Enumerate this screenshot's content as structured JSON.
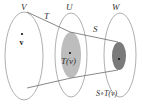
{
  "diagram": {
    "spaces": [
      {
        "id": "V",
        "label": "V",
        "point_label": "v"
      },
      {
        "id": "U",
        "label": "U",
        "point_label": "T(v)"
      },
      {
        "id": "W",
        "label": "W",
        "point_label": "S∘T(v)"
      }
    ],
    "maps": [
      {
        "label": "T",
        "from": "V",
        "to": "U"
      },
      {
        "label": "S",
        "from": "U",
        "to": "W"
      }
    ],
    "colors": {
      "outline": "#9a9a9a",
      "range_T": "#bdbdbd",
      "range_ST": "#7a7a7a",
      "lines": "#6a6a6a"
    }
  }
}
